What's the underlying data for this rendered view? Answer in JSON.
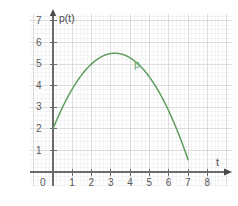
{
  "chart_data": {
    "type": "line",
    "title": "",
    "subtitle": "",
    "xlabel": "t",
    "ylabel": "p(t)",
    "xlim": [
      0,
      8.6
    ],
    "ylim": [
      0,
      7.6
    ],
    "grid": true,
    "minor_grid": true,
    "minor_divisions": 5,
    "legend_position": "inline-annotation",
    "x_ticks": [
      "0",
      "1",
      "2",
      "3",
      "4",
      "5",
      "6",
      "7",
      "8"
    ],
    "x_tick_values": [
      0,
      1,
      2,
      3,
      4,
      5,
      6,
      7,
      8
    ],
    "y_ticks": [
      "1",
      "2",
      "3",
      "4",
      "5",
      "6",
      "7"
    ],
    "y_tick_values": [
      1,
      2,
      3,
      4,
      5,
      6,
      7
    ],
    "series": [
      {
        "name": "p",
        "color": "#5f9e5f",
        "annotation_label": "p",
        "annotation_x": 4.75,
        "annotation_y": 5.15,
        "equation": "p(t) = -0.476(t + 0.6)(t - 7)",
        "vertex": [
          3.2,
          5.5
        ],
        "y_intercept": 2,
        "x_intercept": 7,
        "x": [
          0,
          0.25,
          0.5,
          0.75,
          1,
          1.25,
          1.5,
          1.75,
          2,
          2.25,
          2.5,
          2.75,
          3,
          3.2,
          3.5,
          3.75,
          4,
          4.25,
          4.5,
          4.75,
          5,
          5.25,
          5.5,
          5.75,
          6,
          6.25,
          6.5,
          6.75,
          7
        ],
        "y": [
          2.0,
          2.68,
          3.32,
          3.93,
          4.49,
          5.02,
          5.5,
          5.85,
          5.96,
          5.96,
          5.86,
          5.72,
          5.5,
          5.5,
          5.33,
          5.12,
          4.86,
          4.56,
          4.22,
          3.84,
          3.43,
          2.96,
          2.46,
          1.92,
          1.33,
          0.71,
          0.04,
          -0.35,
          0.0
        ]
      }
    ]
  },
  "axes": {
    "x_axis_label": "t",
    "y_axis_label": "p(t)",
    "origin_label": "0"
  },
  "colors": {
    "curve": "#5f9e5f",
    "axis": "#6b6b6b",
    "major_grid": "#d6d6d6",
    "minor_grid": "#ededed",
    "tick_text": "#5a5a5a",
    "background": "#ffffff"
  }
}
